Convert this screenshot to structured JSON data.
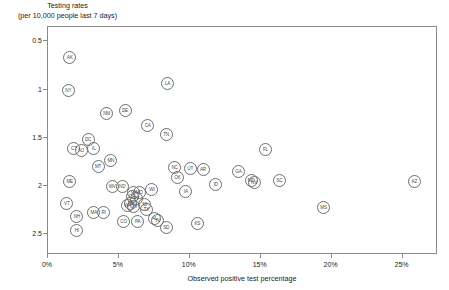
{
  "title": {
    "line1": "Testing rates",
    "line2": "(per 10,000 people last 7 days)"
  },
  "axes": {
    "x_title": "Observed positive test percentage",
    "x_ticks": [
      "0%",
      "5%",
      "10%",
      "15%",
      "20%",
      "25%"
    ],
    "y_ticks": [
      "2.5",
      "2",
      "1.5",
      "1",
      "0.5"
    ]
  },
  "chart_data": {
    "type": "scatter",
    "title": "Testing rates (per 10,000 people last 7 days)",
    "xlabel": "Observed positive test percentage",
    "ylabel": "Testing rates (per 10,000 people last 7 days)",
    "xlim": [
      0,
      27.5
    ],
    "ylim": [
      0.28,
      2.65
    ],
    "xtick_values": [
      0,
      5,
      10,
      15,
      20,
      25
    ],
    "ytick_values": [
      0.5,
      1,
      1.5,
      2,
      2.5
    ],
    "grid": false,
    "legend": "none",
    "point_style": "circle marker labeled with US state abbreviation",
    "points": [
      {
        "label": "AK",
        "x": 1.6,
        "y": 2.32
      },
      {
        "label": "NY",
        "x": 1.5,
        "y": 1.98
      },
      {
        "label": "LA",
        "x": 8.5,
        "y": 2.05
      },
      {
        "label": "NM",
        "x": 4.2,
        "y": 1.74
      },
      {
        "label": "DE",
        "x": 5.5,
        "y": 1.77
      },
      {
        "label": "CA",
        "x": 7.1,
        "y": 1.62
      },
      {
        "label": "TN",
        "x": 8.4,
        "y": 1.52
      },
      {
        "label": "DC",
        "x": 2.9,
        "y": 1.47
      },
      {
        "label": "CT",
        "x": 1.9,
        "y": 1.38
      },
      {
        "label": "NJ",
        "x": 2.4,
        "y": 1.36
      },
      {
        "label": "IL",
        "x": 3.3,
        "y": 1.38
      },
      {
        "label": "MN",
        "x": 4.5,
        "y": 1.25
      },
      {
        "label": "MT",
        "x": 3.6,
        "y": 1.19
      },
      {
        "label": "NC",
        "x": 9.0,
        "y": 1.18
      },
      {
        "label": "UT",
        "x": 10.1,
        "y": 1.17
      },
      {
        "label": "AR",
        "x": 11.0,
        "y": 1.16
      },
      {
        "label": "OK",
        "x": 9.2,
        "y": 1.08
      },
      {
        "label": "ME",
        "x": 1.6,
        "y": 1.03
      },
      {
        "label": "WV",
        "x": 4.6,
        "y": 0.98
      },
      {
        "label": "ND",
        "x": 5.3,
        "y": 0.98
      },
      {
        "label": "ID",
        "x": 11.9,
        "y": 1.0
      },
      {
        "label": "IA",
        "x": 9.8,
        "y": 0.93
      },
      {
        "label": "GA",
        "x": 13.5,
        "y": 1.14
      },
      {
        "label": "MD",
        "x": 14.4,
        "y": 1.04
      },
      {
        "label": "NV",
        "x": 14.6,
        "y": 1.02
      },
      {
        "label": "SC",
        "x": 16.4,
        "y": 1.04
      },
      {
        "label": "FL",
        "x": 15.4,
        "y": 1.37
      },
      {
        "label": "AZ",
        "x": 25.9,
        "y": 1.03
      },
      {
        "label": "MS",
        "x": 19.5,
        "y": 0.76
      },
      {
        "label": "WI",
        "x": 7.4,
        "y": 0.95
      },
      {
        "label": "VA",
        "x": 6.1,
        "y": 0.92
      },
      {
        "label": "OR",
        "x": 6.0,
        "y": 0.88
      },
      {
        "label": "MO",
        "x": 6.5,
        "y": 0.92
      },
      {
        "label": "KY",
        "x": 6.3,
        "y": 0.86
      },
      {
        "label": "NE",
        "x": 5.9,
        "y": 0.8
      },
      {
        "label": "OH",
        "x": 6.1,
        "y": 0.77
      },
      {
        "label": "WA",
        "x": 5.7,
        "y": 0.78
      },
      {
        "label": "MI",
        "x": 6.9,
        "y": 0.79
      },
      {
        "label": "TX",
        "x": 7.0,
        "y": 0.74
      },
      {
        "label": "VT",
        "x": 1.4,
        "y": 0.8
      },
      {
        "label": "NH",
        "x": 2.1,
        "y": 0.67
      },
      {
        "label": "MA",
        "x": 3.3,
        "y": 0.71
      },
      {
        "label": "RI",
        "x": 4.0,
        "y": 0.71
      },
      {
        "label": "HI",
        "x": 2.1,
        "y": 0.52
      },
      {
        "label": "CO",
        "x": 5.4,
        "y": 0.62
      },
      {
        "label": "PA",
        "x": 6.4,
        "y": 0.62
      },
      {
        "label": "AL",
        "x": 7.6,
        "y": 0.65
      },
      {
        "label": "IN",
        "x": 7.8,
        "y": 0.63
      },
      {
        "label": "SD",
        "x": 8.4,
        "y": 0.56
      },
      {
        "label": "KS",
        "x": 10.6,
        "y": 0.6
      }
    ]
  }
}
